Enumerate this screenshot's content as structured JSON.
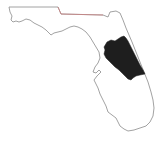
{
  "map": {
    "subject": "Florida state outline",
    "highlighted_region": "Central-east Florida counties",
    "colors": {
      "background": "#ffffff",
      "outline": "#8a8a8a",
      "northern_border": "#c98080",
      "highlight_fill": "#1e1e1e"
    }
  }
}
